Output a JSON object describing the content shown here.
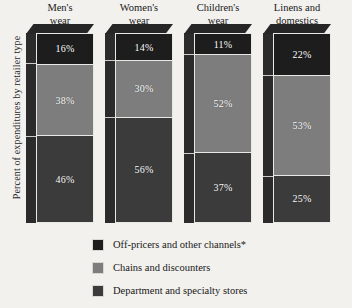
{
  "chart_data": {
    "type": "bar",
    "subtype": "stacked-3d-column",
    "title": "",
    "xlabel": "",
    "ylabel": "Percent of expenditures by retailer type",
    "ylim": [
      0,
      100
    ],
    "grid": false,
    "legend_position": "bottom",
    "units": "%",
    "categories": [
      "Men's\nwear",
      "Women's\nwear",
      "Children's\nwear",
      "Linens and\ndomestics"
    ],
    "series": [
      {
        "name": "Off-pricers and other channels*",
        "color": "#1d1d1d",
        "values": [
          16,
          14,
          11,
          22
        ],
        "labels": [
          "16%",
          "14%",
          "11%",
          "22%"
        ]
      },
      {
        "name": "Chains and discounters",
        "color": "#7d7d7d",
        "values": [
          38,
          30,
          52,
          53
        ],
        "labels": [
          "38%",
          "30%",
          "52%",
          "53%"
        ]
      },
      {
        "name": "Department and specialty stores",
        "color": "#3b3b3b",
        "values": [
          46,
          56,
          37,
          25
        ],
        "labels": [
          "46%",
          "56%",
          "37%",
          "25%"
        ]
      }
    ],
    "stack_order": "top-to-bottom",
    "annotations": [
      "*"
    ]
  },
  "legend": {
    "items": [
      {
        "label": "Off-pricers and other channels*",
        "color": "#1d1d1d"
      },
      {
        "label": "Chains and discounters",
        "color": "#7d7d7d"
      },
      {
        "label": "Department and specialty stores",
        "color": "#3b3b3b"
      }
    ]
  },
  "colors": {
    "background": "#f2f1ee",
    "side_face": "#2b2b2b",
    "segment_border": "#e9e8e4",
    "text": "#1a1a1a",
    "value_text": "#ffffff"
  }
}
